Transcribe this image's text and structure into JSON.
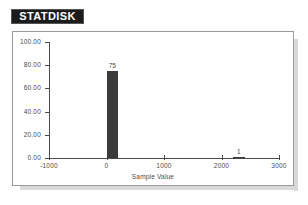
{
  "logo": {
    "text": "STATDISK",
    "background_color": "#1c1c1c",
    "text_color": "#ffffff"
  },
  "chart_data": {
    "type": "bar",
    "title": "",
    "subtitle": "",
    "xlabel": "Sample Value",
    "ylabel": "",
    "xlim": [
      -1000,
      3000
    ],
    "ylim": [
      0,
      100
    ],
    "grid": false,
    "legend": null,
    "bar_color": "#3b3b3b",
    "axis_color": "#4a4a4a",
    "x_ticks": [
      "-1000",
      "0",
      "1000",
      "2000",
      "3000"
    ],
    "x_tick_values": [
      -1000,
      0,
      1000,
      2000,
      3000
    ],
    "y_ticks": [
      "0.00",
      "20.00",
      "40.00",
      "60.00",
      "80.00",
      "100.00"
    ],
    "y_tick_values": [
      0,
      20,
      40,
      60,
      80,
      100
    ],
    "bars": [
      {
        "x_left": 0,
        "x_right": 200,
        "value": 75,
        "data_label": "75"
      },
      {
        "x_left": 2200,
        "x_right": 2400,
        "value": 1,
        "data_label": "1"
      }
    ],
    "categories": [
      "0 to 200",
      "2200 to 2400"
    ],
    "values": [
      75,
      1
    ]
  }
}
